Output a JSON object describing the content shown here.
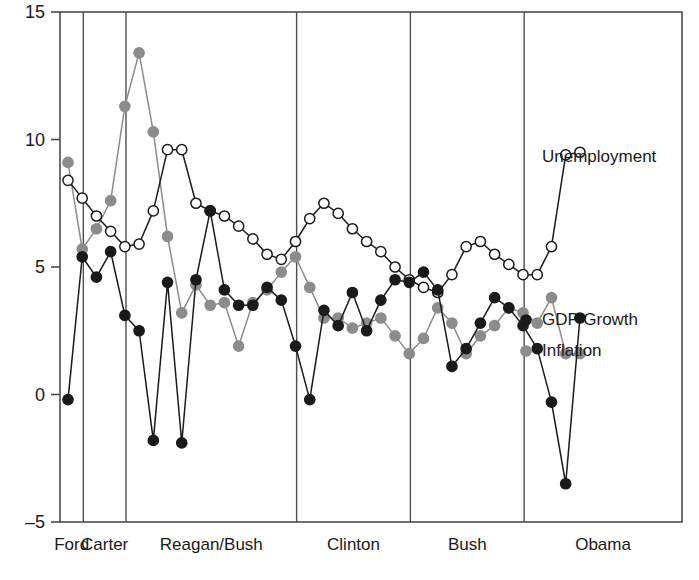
{
  "chart_data": {
    "type": "line",
    "title": "",
    "subtitle": "",
    "xlabel": "",
    "ylabel": "",
    "ylim": [
      -5,
      15
    ],
    "yticks": [
      -5,
      0,
      5,
      10,
      15
    ],
    "ytick_labels": [
      "–5",
      "0",
      "5",
      "10",
      "15"
    ],
    "grid": false,
    "legend_position": "right-inline",
    "x": [
      1974,
      1975,
      1976,
      1977,
      1978,
      1979,
      1980,
      1981,
      1982,
      1983,
      1984,
      1985,
      1986,
      1987,
      1988,
      1989,
      1990,
      1991,
      1992,
      1993,
      1994,
      1995,
      1996,
      1997,
      1998,
      1999,
      2000,
      2001,
      2002,
      2003,
      2004,
      2005,
      2006,
      2007,
      2008,
      2009,
      2010
    ],
    "era_bands": [
      {
        "label": "Ford",
        "start": 1974,
        "end": 1975
      },
      {
        "label": "Carter",
        "start": 1975,
        "end": 1978
      },
      {
        "label": "Reagan/Bush",
        "start": 1978,
        "end": 1990
      },
      {
        "label": "Clinton",
        "start": 1990,
        "end": 1998
      },
      {
        "label": "Bush",
        "start": 1998,
        "end": 2006
      },
      {
        "label": "Obama",
        "start": 2006,
        "end": 2018
      }
    ],
    "series": [
      {
        "name": "Unemployment",
        "marker": "open-circle",
        "color": "#1a1a1a",
        "fill": "#ffffff",
        "values": [
          8.4,
          7.7,
          7.0,
          6.4,
          5.8,
          5.9,
          7.2,
          9.6,
          9.6,
          7.5,
          7.2,
          7.0,
          6.6,
          6.1,
          5.5,
          5.3,
          6.0,
          6.9,
          7.5,
          7.1,
          6.5,
          6.0,
          5.6,
          5.0,
          4.5,
          4.2,
          4.0,
          4.7,
          5.8,
          6.0,
          5.5,
          5.1,
          4.7,
          4.7,
          5.8,
          9.4,
          9.5
        ]
      },
      {
        "name": "Inflation",
        "marker": "filled-circle",
        "color": "#8c8c8c",
        "fill": "#8c8c8c",
        "values": [
          9.1,
          5.7,
          6.5,
          7.6,
          11.3,
          13.4,
          10.3,
          6.2,
          3.2,
          4.3,
          3.5,
          3.6,
          1.9,
          3.6,
          4.1,
          4.8,
          5.4,
          4.2,
          3.0,
          3.0,
          2.6,
          2.8,
          3.0,
          2.3,
          1.6,
          2.2,
          3.4,
          2.8,
          1.6,
          2.3,
          2.7,
          3.4,
          3.2,
          2.8,
          3.8,
          1.6,
          1.6
        ]
      },
      {
        "name": "GDP Growth",
        "marker": "filled-circle",
        "color": "#1a1a1a",
        "fill": "#1a1a1a",
        "values": [
          -0.2,
          5.4,
          4.6,
          5.6,
          3.1,
          2.5,
          -1.8,
          4.4,
          -1.9,
          4.5,
          7.2,
          4.1,
          3.5,
          3.5,
          4.2,
          3.7,
          1.9,
          -0.2,
          3.3,
          2.7,
          4.0,
          2.5,
          3.7,
          4.5,
          4.4,
          4.8,
          4.1,
          1.1,
          1.8,
          2.8,
          3.8,
          3.4,
          2.7,
          1.8,
          -0.3,
          -3.5,
          3.0
        ]
      }
    ],
    "annotations": [
      {
        "text": "Unemployment",
        "series": "Unemployment"
      },
      {
        "text": "GDP Growth",
        "series": "GDP Growth"
      },
      {
        "text": "Inflation",
        "series": "Inflation"
      }
    ]
  },
  "axes": {
    "plot_left": 60,
    "plot_right": 682,
    "plot_top": 12,
    "plot_bottom": 522
  }
}
